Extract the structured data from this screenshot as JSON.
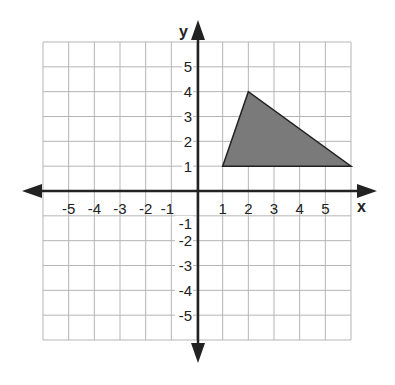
{
  "chart_data": {
    "type": "diagram",
    "title": "",
    "xlabel": "x",
    "ylabel": "y",
    "xlim": [
      -6,
      6
    ],
    "ylim": [
      -6,
      6
    ],
    "grid": true,
    "x_tick_labels": [
      "-5",
      "-4",
      "-3",
      "-2",
      "-1",
      "1",
      "2",
      "3",
      "4",
      "5"
    ],
    "y_tick_labels": [
      "5",
      "4",
      "3",
      "2",
      "1",
      "-1",
      "-2",
      "-3",
      "-4",
      "-5"
    ],
    "shapes": [
      {
        "kind": "triangle",
        "vertices": [
          [
            1,
            1
          ],
          [
            2,
            4
          ],
          [
            6,
            1
          ]
        ],
        "fill": "#7a7a7a",
        "stroke": "#222222"
      }
    ]
  },
  "labels": {
    "x_axis": "x",
    "y_axis": "y"
  },
  "colors": {
    "grid": "#b5b5b5",
    "axis": "#222222",
    "shape_fill": "#7a7a7a"
  }
}
